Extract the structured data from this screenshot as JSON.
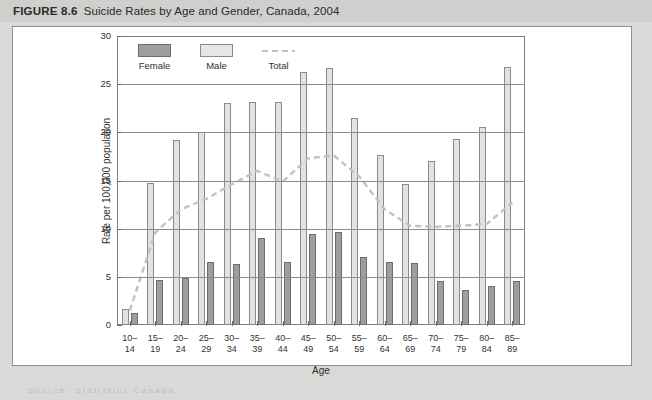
{
  "figure": {
    "number_label": "FIGURE 8.6",
    "title": "Suicide Rates by Age and Gender, Canada, 2004",
    "source_note": "Source: Statistics Canada."
  },
  "legend": {
    "position": "top-left-inside",
    "items": [
      {
        "key": "female",
        "label": "Female",
        "color": "#9e9e9e",
        "marker": "filled-square"
      },
      {
        "key": "male",
        "label": "Male",
        "color": "#e6e6e6",
        "marker": "filled-square"
      },
      {
        "key": "total",
        "label": "Total",
        "color": "#c2c2c2",
        "marker": "dashed-line"
      }
    ]
  },
  "chart_data": {
    "type": "bar",
    "title": "Suicide Rates by Age and Gender, Canada, 2004",
    "xlabel": "Age",
    "ylabel": "Rate per 100,000 population",
    "ylim": [
      0,
      30
    ],
    "yticks": [
      0,
      5,
      10,
      15,
      20,
      25,
      30
    ],
    "grid": "horizontal",
    "legend_position": "top-left-inside",
    "categories": [
      "10–14",
      "15–19",
      "20–24",
      "25–29",
      "30–34",
      "35–39",
      "40–44",
      "45–49",
      "50–54",
      "55–59",
      "60–64",
      "65–69",
      "70–74",
      "75–79",
      "80–84",
      "85–89"
    ],
    "series": [
      {
        "name": "Male",
        "type": "bar",
        "color": "#e2e2e2",
        "values": [
          1.7,
          14.7,
          19.2,
          20.0,
          23.0,
          23.1,
          23.1,
          26.3,
          26.7,
          21.5,
          17.6,
          14.6,
          17.0,
          19.3,
          20.6,
          26.8
        ]
      },
      {
        "name": "Female",
        "type": "bar",
        "color": "#9e9e9e",
        "values": [
          1.2,
          4.7,
          4.9,
          6.5,
          6.3,
          9.0,
          6.5,
          9.4,
          9.7,
          7.1,
          6.5,
          6.4,
          4.6,
          3.6,
          4.1,
          4.6
        ]
      },
      {
        "name": "Total",
        "type": "line",
        "style": "dashed",
        "color": "#c2c2c2",
        "values": [
          1.5,
          9.6,
          12.0,
          13.1,
          14.6,
          16.0,
          14.9,
          17.3,
          17.6,
          15.4,
          12.0,
          10.3,
          10.2,
          10.3,
          10.5,
          12.7
        ]
      }
    ]
  }
}
